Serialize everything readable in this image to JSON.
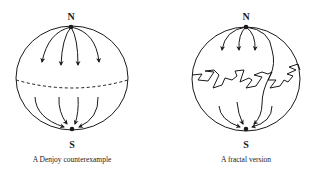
{
  "figures": [
    {
      "id": "left",
      "caption": "A Denjoy counterexample",
      "north_label": "N",
      "south_label": "S",
      "equator_style": "dashed"
    },
    {
      "id": "right",
      "caption": "A fractal version",
      "north_label": "N",
      "south_label": "S",
      "equator_style": "fractal-zigzag"
    }
  ],
  "colors": {
    "ink": "#1a1a1a",
    "background": "#ffffff"
  }
}
